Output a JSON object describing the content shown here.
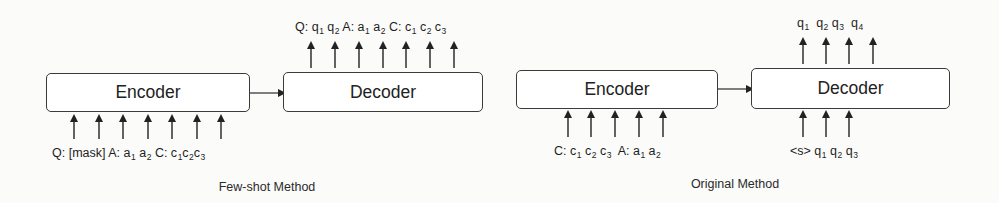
{
  "panels": [
    {
      "id": "few-shot",
      "caption": "Few-shot Method",
      "encoder": {
        "label": "Encoder",
        "inputs": [
          {
            "text": "Q: [mask]",
            "sub": ""
          },
          {
            "text": " A: a",
            "sub": "1"
          },
          {
            "text": " a",
            "sub": "2"
          },
          {
            "text": " C: c",
            "sub": "1"
          },
          {
            "text": "c",
            "sub": "2"
          },
          {
            "text": "c",
            "sub": "3"
          }
        ],
        "input_arrow_count": 7
      },
      "decoder": {
        "label": "Decoder",
        "inputs": [],
        "outputs": [
          {
            "text": "Q: q",
            "sub": "1"
          },
          {
            "text": " q",
            "sub": "2"
          },
          {
            "text": " A: a",
            "sub": "1"
          },
          {
            "text": " a",
            "sub": "2"
          },
          {
            "text": " C: c",
            "sub": "1"
          },
          {
            "text": " c",
            "sub": "2"
          },
          {
            "text": " c",
            "sub": "3"
          }
        ],
        "output_arrow_count": 7
      }
    },
    {
      "id": "original",
      "caption": "Original Method",
      "encoder": {
        "label": "Encoder",
        "inputs": [
          {
            "text": "C: c",
            "sub": "1"
          },
          {
            "text": " c",
            "sub": "2"
          },
          {
            "text": " c",
            "sub": "3"
          },
          {
            "text": "  A: a",
            "sub": "1"
          },
          {
            "text": " a",
            "sub": "2"
          }
        ],
        "input_arrow_count": 5
      },
      "decoder": {
        "label": "Decoder",
        "inputs": [
          {
            "text": "<s> q",
            "sub": "1"
          },
          {
            "text": " q",
            "sub": "2"
          },
          {
            "text": " q",
            "sub": "3"
          }
        ],
        "input_arrow_count": 3,
        "outputs": [
          {
            "text": "q",
            "sub": "1"
          },
          {
            "text": "  q",
            "sub": "2"
          },
          {
            "text": " q",
            "sub": "3"
          },
          {
            "text": "  q",
            "sub": "4"
          }
        ],
        "output_arrow_count": 4
      }
    }
  ],
  "colors": {
    "stroke": "#2a2a2a",
    "box_fill": "#ffffff",
    "background": "#fbfbfa"
  }
}
